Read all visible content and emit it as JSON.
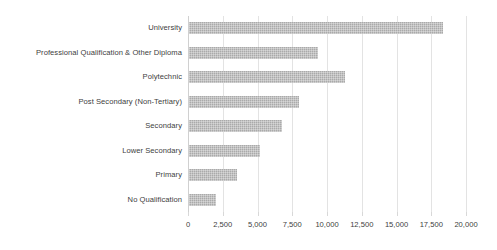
{
  "chart_data": {
    "type": "bar",
    "orientation": "horizontal",
    "title": "",
    "subtitle": "",
    "xlabel": "",
    "ylabel": "",
    "categories": [
      "University",
      "Professional Qualification & Other Diploma",
      "Polytechnic",
      "Post Secondary (Non-Tertiary)",
      "Secondary",
      "Lower Secondary",
      "Primary",
      "No Qualification"
    ],
    "values": [
      18300,
      9300,
      11200,
      7900,
      6700,
      5100,
      3450,
      1950
    ],
    "series": [
      {
        "name": "",
        "values": [
          18300,
          9300,
          11200,
          7900,
          6700,
          5100,
          3450,
          1950
        ]
      }
    ],
    "xlim": [
      0,
      20000
    ],
    "xticks": [
      0,
      2500,
      5000,
      7500,
      10000,
      12500,
      15000,
      17500,
      20000
    ],
    "xtick_labels": [
      "0",
      "2,500",
      "5,000",
      "7,500",
      "10,000",
      "12,500",
      "15,000",
      "17,500",
      "20,000"
    ],
    "grid": true,
    "grid_axis": "x",
    "legend": false,
    "legend_position": "none",
    "bar_color": "#aaaaaa",
    "bar_pattern": "dotted-texture",
    "gridline_color": "#e3e3e3",
    "axis_color": "#d0d0d0",
    "text_color": "#404040",
    "background_color": "#ffffff",
    "data_labels": false
  }
}
